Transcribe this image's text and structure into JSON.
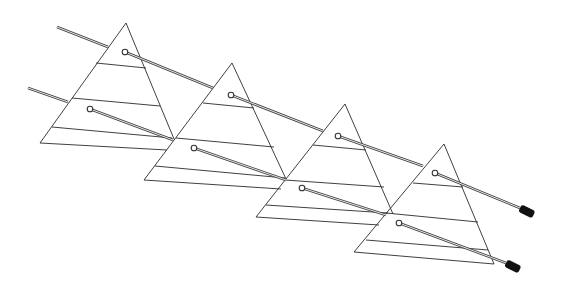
{
  "figure": {
    "colors": {
      "line": "#2a2a2a",
      "rod": "#444444",
      "cap": "#111111",
      "background": "#ffffff"
    }
  },
  "triangles": [
    {
      "id": "plate-1",
      "apex": [
        126,
        23
      ],
      "base_left": [
        40,
        143
      ],
      "base_right": [
        167,
        150
      ],
      "right_edge_end": [
        174,
        139
      ],
      "crosslines": [
        [
          [
            96,
            63
          ],
          [
            146,
            68
          ]
        ],
        [
          [
            72,
            98
          ],
          [
            160,
            106
          ]
        ],
        [
          [
            52,
            127
          ],
          [
            172,
            138
          ]
        ]
      ]
    },
    {
      "id": "plate-2",
      "apex": [
        232,
        63
      ],
      "base_left": [
        144,
        180
      ],
      "base_right": [
        281,
        189
      ],
      "right_edge_end": [
        286,
        179
      ],
      "crosslines": [
        [
          [
            203,
            103
          ],
          [
            254,
            108
          ]
        ],
        [
          [
            176,
            138
          ],
          [
            274,
            147
          ]
        ],
        [
          [
            155,
            166
          ],
          [
            285,
            178
          ]
        ]
      ]
    },
    {
      "id": "plate-3",
      "apex": [
        345,
        104
      ],
      "base_left": [
        256,
        217
      ],
      "base_right": [
        379,
        225
      ],
      "right_edge_end": [
        393,
        214
      ],
      "crosslines": [
        [
          [
            313,
            145
          ],
          [
            366,
            150
          ]
        ],
        [
          [
            285,
            180
          ],
          [
            384,
            187
          ]
        ],
        [
          [
            266,
            205
          ],
          [
            388,
            213
          ]
        ]
      ]
    },
    {
      "id": "plate-4",
      "apex": [
        444,
        144
      ],
      "base_left": [
        354,
        252
      ],
      "base_right": [
        494,
        264
      ],
      "right_edge_end": [
        494,
        264
      ],
      "crosslines": [
        [
          [
            413,
            183
          ],
          [
            463,
            187
          ]
        ],
        [
          [
            386,
            213
          ],
          [
            478,
            222
          ]
        ],
        [
          [
            366,
            240
          ],
          [
            488,
            250
          ]
        ]
      ]
    }
  ],
  "rods": [
    {
      "id": "upper-rod",
      "segments": [
        [
          [
            57,
            27
          ],
          [
            108,
            47
          ]
        ],
        [
          [
            125,
            52
          ],
          [
            213,
            88
          ]
        ],
        [
          [
            231,
            95
          ],
          [
            323,
            131
          ]
        ],
        [
          [
            338,
            136
          ],
          [
            423,
            166
          ]
        ],
        [
          [
            435,
            173
          ],
          [
            520,
            208
          ]
        ]
      ],
      "pivots": [
        [
          125,
          52
        ],
        [
          231,
          95
        ],
        [
          338,
          136
        ],
        [
          435,
          173
        ]
      ],
      "cap": {
        "from": [
          520,
          208
        ],
        "to": [
          530,
          213
        ]
      }
    },
    {
      "id": "lower-rod",
      "segments": [
        [
          [
            28,
            88
          ],
          [
            68,
            102
          ]
        ],
        [
          [
            90,
            109
          ],
          [
            173,
            140
          ]
        ],
        [
          [
            194,
            148
          ],
          [
            286,
            180
          ]
        ],
        [
          [
            302,
            188
          ],
          [
            386,
            215
          ]
        ],
        [
          [
            399,
            223
          ],
          [
            506,
            263
          ]
        ]
      ],
      "pivots": [
        [
          90,
          109
        ],
        [
          194,
          148
        ],
        [
          302,
          188
        ],
        [
          399,
          223
        ]
      ],
      "cap": {
        "from": [
          506,
          263
        ],
        "to": [
          516,
          268
        ]
      }
    }
  ]
}
